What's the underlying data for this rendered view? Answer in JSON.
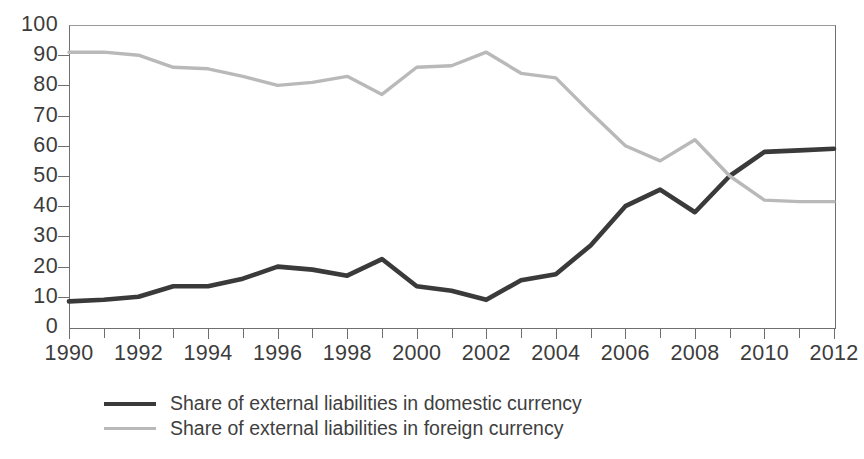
{
  "chart_data": {
    "type": "line",
    "title": "",
    "subtitle": "",
    "xlabel": "",
    "ylabel": "",
    "xlim": [
      1990,
      2012
    ],
    "ylim": [
      0,
      100
    ],
    "grid": false,
    "legend_position": "bottom-left",
    "x": [
      1990,
      1991,
      1992,
      1993,
      1994,
      1995,
      1996,
      1997,
      1998,
      1999,
      2000,
      2001,
      2002,
      2003,
      2004,
      2005,
      2006,
      2007,
      2008,
      2009,
      2010,
      2011,
      2012
    ],
    "y_ticks": [
      0,
      10,
      20,
      30,
      40,
      50,
      60,
      70,
      80,
      90,
      100
    ],
    "x_tick_labels": [
      "1990",
      "1992",
      "1994",
      "1996",
      "1998",
      "2000",
      "2002",
      "2004",
      "2006",
      "2008",
      "2010",
      "2012"
    ],
    "x_tick_label_years": [
      1990,
      1992,
      1994,
      1996,
      1998,
      2000,
      2002,
      2004,
      2006,
      2008,
      2010,
      2012
    ],
    "series": [
      {
        "name": "Share of external liabilities in domestic currency",
        "color": "#3a3a3a",
        "width": 4.6,
        "values": [
          8.5,
          9.0,
          10.0,
          13.5,
          13.5,
          16.0,
          20.0,
          19.0,
          17.0,
          22.5,
          13.5,
          12.0,
          9.0,
          15.5,
          17.5,
          27.0,
          40.0,
          45.5,
          38.0,
          50.0,
          58.0,
          58.5,
          59.0
        ]
      },
      {
        "name": "Share of external liabilities in foreign currency",
        "color": "#b9b9b9",
        "width": 3.4,
        "values": [
          91.0,
          91.0,
          90.0,
          86.0,
          85.5,
          83.0,
          80.0,
          81.0,
          83.0,
          77.0,
          86.0,
          86.5,
          91.0,
          84.0,
          82.5,
          71.0,
          60.0,
          55.0,
          62.0,
          50.0,
          42.0,
          41.5,
          41.5
        ]
      }
    ]
  },
  "legend": {
    "items": [
      {
        "label": "Share of external liabilities in domestic currency"
      },
      {
        "label": "Share of external liabilities in foreign currency"
      }
    ]
  },
  "colors": {
    "domestic_line": "#3a3a3a",
    "foreign_line": "#b9b9b9",
    "axis": "#6f6f6f",
    "text": "#3c3c3c",
    "background": "#ffffff"
  }
}
